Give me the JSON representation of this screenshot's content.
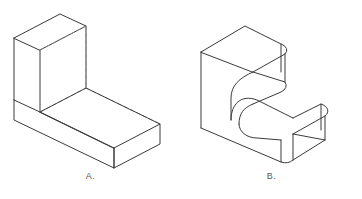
{
  "sheet": {
    "title": "Isometric Solids Comparison",
    "background_color": "#ffffff",
    "visible_edge_color": "#3a3a3a",
    "hidden_edge_color": "#8d8d8d",
    "caption_color": "#5b5b5b"
  },
  "figures": [
    {
      "id": "a",
      "caption": "A.",
      "description": "L-shaped block, isometric view, sharp edges with dashed hidden lines",
      "edge_style": "sharp",
      "hidden_lines": true
    },
    {
      "id": "b",
      "caption": "B.",
      "description": "L-shaped block, isometric view, filleted and rounded edges",
      "edge_style": "rounded",
      "hidden_lines": false
    }
  ]
}
